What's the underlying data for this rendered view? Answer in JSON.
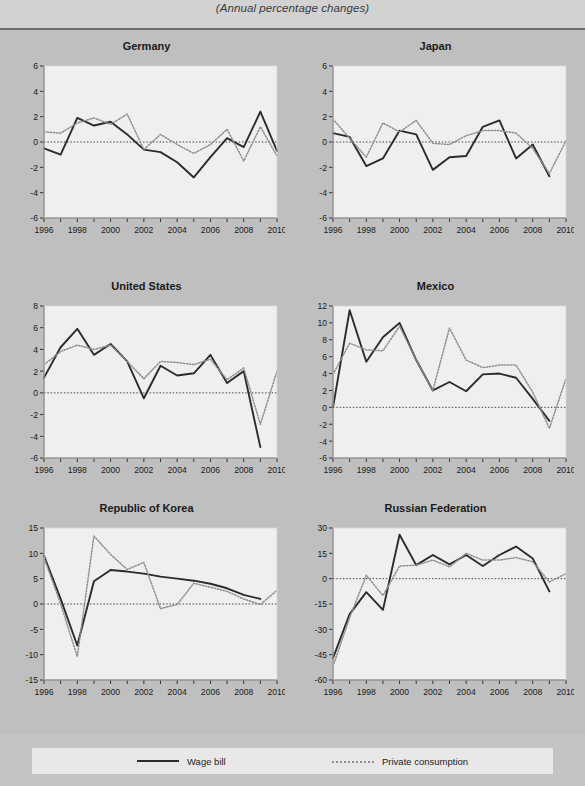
{
  "subtitle": "(Annual percentage changes)",
  "legend": {
    "series_solid": "Wage bill",
    "series_dotted": "Private consumption"
  },
  "colors": {
    "page_background": "#bfbfbf",
    "plot_background": "#efefef",
    "solid_line": "#2b2b2b",
    "dotted_line": "#8f8f8f",
    "axis": "#333333",
    "legend_background": "#e8e8e8"
  },
  "panels": [
    {
      "key": "germany",
      "title": "Germany"
    },
    {
      "key": "japan",
      "title": "Japan"
    },
    {
      "key": "united_states",
      "title": "United States"
    },
    {
      "key": "mexico",
      "title": "Mexico"
    },
    {
      "key": "republic_of_korea",
      "title": "Republic of Korea"
    },
    {
      "key": "russian_federation",
      "title": "Russian Federation"
    }
  ],
  "chart_data": [
    {
      "type": "line",
      "title": "Germany",
      "xlabel": "",
      "ylabel": "",
      "x": [
        1996,
        1997,
        1998,
        1999,
        2000,
        2001,
        2002,
        2003,
        2004,
        2005,
        2006,
        2007,
        2008,
        2009,
        2010
      ],
      "xticks": [
        1996,
        1998,
        2000,
        2002,
        2004,
        2006,
        2008,
        2010
      ],
      "ylim": [
        -6,
        6
      ],
      "yticks": [
        -6,
        -4,
        -2,
        0,
        2,
        4,
        6
      ],
      "grid": false,
      "legend_position": "figure-bottom",
      "series": [
        {
          "name": "Wage bill",
          "style": "solid",
          "values": [
            -0.5,
            -1.0,
            1.9,
            1.3,
            1.6,
            0.6,
            -0.6,
            -0.8,
            -1.6,
            -2.8,
            -1.2,
            0.3,
            -0.4,
            2.4,
            -0.7,
            0.8
          ]
        },
        {
          "name": "Private consumption",
          "style": "dotted",
          "values": [
            0.8,
            0.7,
            1.5,
            1.9,
            1.4,
            2.2,
            -0.6,
            0.6,
            -0.2,
            -0.9,
            -0.2,
            1.0,
            -1.5,
            1.2,
            -1.1,
            0.6
          ]
        }
      ]
    },
    {
      "type": "line",
      "title": "Japan",
      "xlabel": "",
      "ylabel": "",
      "x": [
        1996,
        1997,
        1998,
        1999,
        2000,
        2001,
        2002,
        2003,
        2004,
        2005,
        2006,
        2007,
        2008,
        2009,
        2010
      ],
      "xticks": [
        1996,
        1998,
        2000,
        2002,
        2004,
        2006,
        2008,
        2010
      ],
      "ylim": [
        -6,
        6
      ],
      "yticks": [
        -6,
        -4,
        -2,
        0,
        2,
        4,
        6
      ],
      "grid": false,
      "legend_position": "figure-bottom",
      "series": [
        {
          "name": "Wage bill",
          "style": "solid",
          "values": [
            0.7,
            0.4,
            -1.9,
            -1.3,
            0.9,
            0.6,
            -2.2,
            -1.2,
            -1.1,
            1.2,
            1.7,
            -1.3,
            -0.2,
            -2.7
          ]
        },
        {
          "name": "Private consumption",
          "style": "dotted",
          "values": [
            1.8,
            0.3,
            -1.2,
            1.5,
            0.8,
            1.7,
            -0.1,
            -0.2,
            0.5,
            0.9,
            0.9,
            0.7,
            -0.5,
            -2.5,
            0.1
          ]
        }
      ]
    },
    {
      "type": "line",
      "title": "United States",
      "xlabel": "",
      "ylabel": "",
      "x": [
        1996,
        1997,
        1998,
        1999,
        2000,
        2001,
        2002,
        2003,
        2004,
        2005,
        2006,
        2007,
        2008,
        2009,
        2010
      ],
      "xticks": [
        1996,
        1998,
        2000,
        2002,
        2004,
        2006,
        2008,
        2010
      ],
      "ylim": [
        -6,
        8
      ],
      "yticks": [
        -6,
        -4,
        -2,
        0,
        2,
        4,
        6,
        8
      ],
      "grid": false,
      "legend_position": "figure-bottom",
      "series": [
        {
          "name": "Wage bill",
          "style": "solid",
          "values": [
            1.4,
            4.2,
            5.9,
            3.5,
            4.5,
            2.9,
            -0.5,
            2.5,
            1.6,
            1.8,
            3.5,
            0.9,
            2.0,
            -5.0
          ]
        },
        {
          "name": "Private consumption",
          "style": "dotted",
          "values": [
            2.6,
            3.8,
            4.4,
            4.0,
            4.4,
            2.9,
            1.3,
            2.9,
            2.8,
            2.6,
            3.1,
            1.2,
            2.3,
            -2.9,
            2.0
          ]
        }
      ]
    },
    {
      "type": "line",
      "title": "Mexico",
      "xlabel": "",
      "ylabel": "",
      "x": [
        1996,
        1997,
        1998,
        1999,
        2000,
        2001,
        2002,
        2003,
        2004,
        2005,
        2006,
        2007,
        2008,
        2009,
        2010
      ],
      "xticks": [
        1996,
        1998,
        2000,
        2002,
        2004,
        2006,
        2008,
        2010
      ],
      "ylim": [
        -6,
        12
      ],
      "yticks": [
        -6,
        -4,
        -2,
        0,
        2,
        4,
        6,
        8,
        10,
        12
      ],
      "grid": false,
      "legend_position": "figure-bottom",
      "series": [
        {
          "name": "Wage bill",
          "style": "solid",
          "values": [
            0.0,
            11.5,
            5.4,
            8.3,
            10.0,
            5.6,
            2.0,
            3.0,
            1.9,
            3.9,
            4.0,
            3.5,
            1.0,
            -1.6
          ]
        },
        {
          "name": "Private consumption",
          "style": "dotted",
          "values": [
            3.9,
            7.6,
            6.8,
            6.7,
            9.6,
            5.6,
            2.0,
            9.4,
            5.6,
            4.7,
            5.0,
            5.0,
            1.8,
            -2.5,
            3.4
          ]
        }
      ]
    },
    {
      "type": "line",
      "title": "Republic of Korea",
      "xlabel": "",
      "ylabel": "",
      "x": [
        1996,
        1997,
        1998,
        1999,
        2000,
        2001,
        2002,
        2003,
        2004,
        2005,
        2006,
        2007,
        2008,
        2009,
        2010
      ],
      "xticks": [
        1996,
        1998,
        2000,
        2002,
        2004,
        2006,
        2008,
        2010
      ],
      "ylim": [
        -15,
        15
      ],
      "yticks": [
        -15,
        -10,
        -5,
        0,
        5,
        10,
        15
      ],
      "grid": false,
      "legend_position": "figure-bottom",
      "series": [
        {
          "name": "Wage bill",
          "style": "solid",
          "values": [
            9.5,
            1.0,
            -8.2,
            4.5,
            6.7,
            6.4,
            6.0,
            5.4,
            5.0,
            4.6,
            4.0,
            3.1,
            1.8,
            1.0
          ]
        },
        {
          "name": "Private consumption",
          "style": "dotted",
          "values": [
            9.2,
            0.0,
            -10.4,
            13.4,
            9.8,
            6.8,
            8.2,
            -0.9,
            -0.1,
            4.1,
            3.3,
            2.5,
            1.0,
            -0.1,
            2.7
          ]
        }
      ]
    },
    {
      "type": "line",
      "title": "Russian Federation",
      "xlabel": "",
      "ylabel": "",
      "x": [
        1996,
        1997,
        1998,
        1999,
        2000,
        2001,
        2002,
        2003,
        2004,
        2005,
        2006,
        2007,
        2008,
        2009,
        2010
      ],
      "xticks": [
        1996,
        1998,
        2000,
        2002,
        2004,
        2006,
        2008,
        2010
      ],
      "ylim": [
        -60,
        30
      ],
      "yticks": [
        -60,
        -45,
        -30,
        -15,
        0,
        15,
        30
      ],
      "grid": false,
      "legend_position": "figure-bottom",
      "series": [
        {
          "name": "Wage bill",
          "style": "solid",
          "values": [
            -47,
            -21,
            -8,
            -18.5,
            26,
            8,
            14,
            8.5,
            14,
            7.5,
            14,
            19,
            12,
            -7.5
          ]
        },
        {
          "name": "Private consumption",
          "style": "dotted",
          "values": [
            -52,
            -23,
            2,
            -10,
            7.5,
            8,
            11,
            7,
            15,
            11,
            11,
            12.5,
            10,
            -2,
            3
          ]
        }
      ]
    }
  ]
}
